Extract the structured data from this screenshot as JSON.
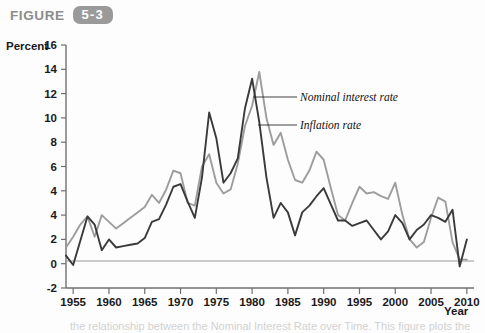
{
  "figure": {
    "label": "FIGURE",
    "number": "5-3",
    "badge_color": "#9a9a9a"
  },
  "axes": {
    "ylabel": "Percent",
    "xlabel": "Year",
    "y_ticks": [
      "16",
      "14",
      "12",
      "10",
      "8",
      "6",
      "4",
      "4",
      "2",
      "0",
      "-2"
    ],
    "x_ticks": [
      "1955",
      "1960",
      "1965",
      "1970",
      "1975",
      "1980",
      "1985",
      "1990",
      "1995",
      "2000",
      "2005",
      "2010"
    ]
  },
  "annotations": {
    "nominal_label": "Nominal interest rate",
    "inflation_label": "Inflation rate"
  },
  "caption_bleed": "the relationship between the Nominal Interest Rate over Time. This figure plots the",
  "chart_data": {
    "type": "line",
    "title": "",
    "xlabel": "Year",
    "ylabel": "Percent",
    "xlim": [
      1954,
      2011
    ],
    "ylim": [
      -2,
      16
    ],
    "grid": false,
    "legend": "inline-annotation",
    "colors": {
      "nominal": "#9d9d9d",
      "inflation": "#3a3a3a"
    },
    "x": [
      1954,
      1955,
      1956,
      1957,
      1958,
      1959,
      1960,
      1961,
      1962,
      1963,
      1964,
      1965,
      1966,
      1967,
      1968,
      1969,
      1970,
      1971,
      1972,
      1973,
      1974,
      1975,
      1976,
      1977,
      1978,
      1979,
      1980,
      1981,
      1982,
      1983,
      1984,
      1985,
      1986,
      1987,
      1988,
      1989,
      1990,
      1991,
      1992,
      1993,
      1994,
      1995,
      1996,
      1997,
      1998,
      1999,
      2000,
      2001,
      2002,
      2003,
      2004,
      2005,
      2006,
      2007,
      2008,
      2009,
      2010
    ],
    "series": [
      {
        "name": "Nominal interest rate",
        "values": [
          1.0,
          1.8,
          2.7,
          3.3,
          1.8,
          3.4,
          2.9,
          2.4,
          2.8,
          3.2,
          3.6,
          4.0,
          4.9,
          4.3,
          5.3,
          6.7,
          6.5,
          4.3,
          4.1,
          7.0,
          7.9,
          5.8,
          5.0,
          5.3,
          7.2,
          10.0,
          11.5,
          14.0,
          10.6,
          8.6,
          9.5,
          7.5,
          6.0,
          5.8,
          6.7,
          8.1,
          7.5,
          5.4,
          3.4,
          3.0,
          4.3,
          5.5,
          5.0,
          5.1,
          4.8,
          4.6,
          5.8,
          3.4,
          1.6,
          1.0,
          1.4,
          3.2,
          4.7,
          4.4,
          1.4,
          0.1,
          0.1
        ]
      },
      {
        "name": "Inflation rate",
        "values": [
          0.4,
          -0.3,
          1.5,
          3.3,
          2.7,
          0.8,
          1.6,
          1.0,
          1.1,
          1.2,
          1.3,
          1.7,
          2.9,
          3.1,
          4.2,
          5.5,
          5.7,
          4.4,
          3.2,
          6.2,
          11.0,
          9.1,
          5.8,
          6.5,
          7.6,
          11.3,
          13.5,
          10.3,
          6.2,
          3.2,
          4.3,
          3.6,
          1.9,
          3.6,
          4.1,
          4.8,
          5.4,
          4.2,
          3.0,
          3.0,
          2.6,
          2.8,
          3.0,
          2.3,
          1.6,
          2.2,
          3.4,
          2.8,
          1.6,
          2.3,
          2.7,
          3.4,
          3.2,
          2.9,
          3.8,
          -0.4,
          1.6
        ]
      }
    ]
  }
}
